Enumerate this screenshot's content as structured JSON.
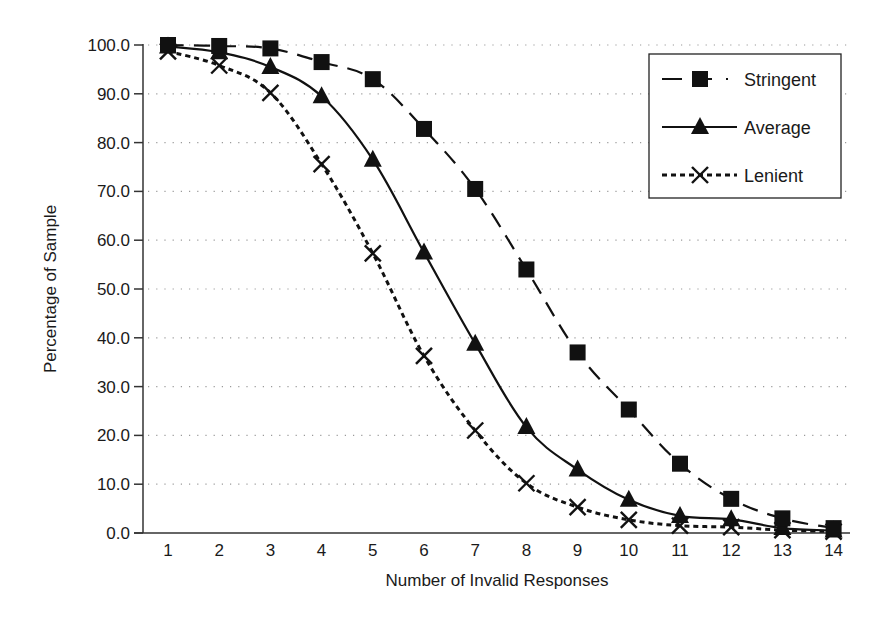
{
  "chart_data": {
    "type": "line",
    "title": "",
    "xlabel": "Number of Invalid Responses",
    "ylabel": "Percentage of Sample",
    "x": [
      1,
      2,
      3,
      4,
      5,
      6,
      7,
      8,
      9,
      10,
      11,
      12,
      13,
      14
    ],
    "x_tick_labels": [
      "1",
      "2",
      "3",
      "4",
      "5",
      "6",
      "7",
      "8",
      "9",
      "10",
      "11",
      "12",
      "13",
      "14"
    ],
    "ylim": [
      0,
      100
    ],
    "y_ticks": [
      0,
      10,
      20,
      30,
      40,
      50,
      60,
      70,
      80,
      90,
      100
    ],
    "y_tick_labels": [
      "0.0",
      "10.0",
      "20.0",
      "30.0",
      "40.0",
      "50.0",
      "60.0",
      "70.0",
      "80.0",
      "90.0",
      "100.0"
    ],
    "grid": "horizontal-dotted",
    "legend_position": "top-right",
    "series": [
      {
        "name": "Stringent",
        "line_style": "dashed",
        "marker": "square",
        "values": [
          100.0,
          99.8,
          99.3,
          96.5,
          93.0,
          82.8,
          70.5,
          54.0,
          37.0,
          25.3,
          14.2,
          7.0,
          3.0,
          1.0
        ]
      },
      {
        "name": "Average",
        "line_style": "solid",
        "marker": "triangle",
        "values": [
          99.7,
          98.5,
          95.5,
          89.5,
          76.5,
          57.5,
          38.8,
          21.7,
          13.0,
          6.8,
          3.5,
          2.8,
          1.0,
          0.5
        ]
      },
      {
        "name": "Lenient",
        "line_style": "dotted",
        "marker": "x",
        "values": [
          98.7,
          95.8,
          90.2,
          75.6,
          57.3,
          36.3,
          21.0,
          10.2,
          5.3,
          2.7,
          1.5,
          1.2,
          0.6,
          0.3
        ]
      }
    ],
    "colors": {
      "line": "#111111",
      "grid": "#9a9a9a",
      "axis": "#333333"
    }
  }
}
